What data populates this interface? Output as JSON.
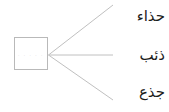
{
  "diagram": {
    "type": "radial-branch",
    "background_color": "#ffffff",
    "line_color": "#c0c0c0",
    "box_border_color": "#b9b9b9",
    "text_color": "#1c1c1c",
    "source": {
      "label": "",
      "faint_content": ". . . . ."
    },
    "branches": [
      {
        "label": "حذاء",
        "direction": "up"
      },
      {
        "label": "ذئب",
        "direction": "straight"
      },
      {
        "label": "جذع",
        "direction": "down"
      }
    ]
  }
}
